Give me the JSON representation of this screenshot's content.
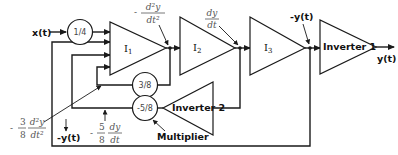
{
  "diagram": {
    "type": "analog computer block diagram",
    "input": {
      "label": "x(t)"
    },
    "output": {
      "label": "y(t)"
    },
    "blocks": [
      {
        "id": "gain_in",
        "type": "multiplier",
        "label": "1/4"
      },
      {
        "id": "I1",
        "type": "integrator",
        "label": "I",
        "sub": "1"
      },
      {
        "id": "I2",
        "type": "integrator",
        "label": "I",
        "sub": "2"
      },
      {
        "id": "I3",
        "type": "integrator",
        "label": "I",
        "sub": "3"
      },
      {
        "id": "inv1",
        "type": "inverter",
        "label": "Inverter 1"
      },
      {
        "id": "inv2",
        "type": "inverter",
        "label": "Inverter 2"
      },
      {
        "id": "gain_38",
        "type": "multiplier",
        "label": "3/8"
      },
      {
        "id": "gain_58",
        "type": "multiplier",
        "label": "-5/8"
      }
    ],
    "signal_labels": {
      "i1_out": {
        "sign": "-",
        "num": "d²y",
        "den": "dt²"
      },
      "i2_out": {
        "sign": "",
        "num": "dy",
        "den": "dt"
      },
      "i3_out": {
        "text": "-y(t)"
      },
      "fb_38": {
        "sign": "-",
        "coef_num": "3",
        "coef_den": "8",
        "num": "d²y",
        "den": "dt²"
      },
      "fb_58": {
        "sign": "-",
        "coef_num": "5",
        "coef_den": "8",
        "num": "dy",
        "den": "dt"
      },
      "fb_outer": {
        "text": "-y(t)"
      }
    },
    "annotations": {
      "multiplier_note": "Multiplier"
    }
  }
}
